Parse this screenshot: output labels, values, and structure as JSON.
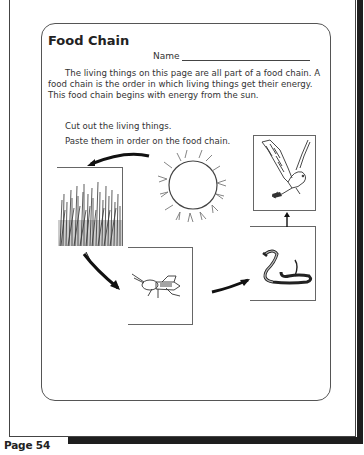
{
  "worksheet": {
    "title": "Food Chain",
    "name_label": "Name",
    "intro_text": "The living things on this page are all part of a food chain. A food chain is the order in which living things get their energy. This food chain begins with energy from the sun.",
    "instructions": [
      "Cut out the living things.",
      "Paste them in order on the food chain."
    ],
    "pictures": [
      {
        "name": "sun",
        "icon": "sun-icon"
      },
      {
        "name": "grass",
        "icon": "grass-icon"
      },
      {
        "name": "grasshopper",
        "icon": "grasshopper-icon"
      },
      {
        "name": "snake",
        "icon": "snake-icon"
      },
      {
        "name": "hawk",
        "icon": "hawk-icon"
      }
    ],
    "chain_order": [
      "sun",
      "grass",
      "grasshopper",
      "snake",
      "hawk"
    ]
  },
  "footer": {
    "page_label": "Page 54"
  },
  "colors": {
    "ink": "#2a2a2a",
    "shadow": "#1e1e1e",
    "paper": "#ffffff"
  }
}
